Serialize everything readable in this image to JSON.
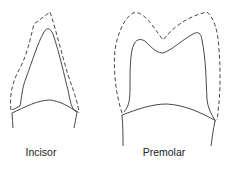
{
  "figure": {
    "teeth": [
      {
        "id": "incisor",
        "label": "Incisor",
        "label_x": 41
      },
      {
        "id": "premolar",
        "label": "Premolar",
        "label_x": 164
      }
    ],
    "legend": {
      "dashed": "outer outline",
      "solid": "inner outline"
    },
    "colors": {
      "stroke": "#333333",
      "background": "#ffffff"
    }
  }
}
